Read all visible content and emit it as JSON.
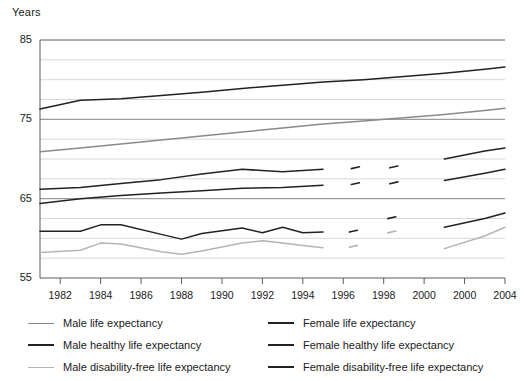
{
  "chart_data": {
    "type": "line",
    "title": "",
    "subtitle": "",
    "ylabel": "Years",
    "xlabel": "",
    "ylim": [
      55,
      85
    ],
    "yticks": [
      55,
      65,
      75,
      85
    ],
    "ytick_labels": [
      "55",
      "65",
      "75",
      "85"
    ],
    "grid": "horizontal-minor-every-2.5-years",
    "gridlines": [
      57.5,
      60,
      62.5,
      65,
      67.5,
      70,
      72.5,
      75,
      77.5,
      80,
      82.5
    ],
    "xlim": [
      1981,
      2004
    ],
    "xticks": [
      1982,
      1984,
      1986,
      1988,
      1990,
      1992,
      1994,
      1996,
      1998,
      2000,
      2002,
      2004
    ],
    "xtick_labels": [
      "1982",
      "1984",
      "1986",
      "1988",
      "1990",
      "1992",
      "1994",
      "1996",
      "1998",
      "2000",
      "2000",
      "2004"
    ],
    "legend_position": "bottom",
    "colors": {
      "male_life": "#8a8a8a",
      "male_healthy": "#222222",
      "male_disability_free": "#b4b4b4",
      "female_life": "#222222",
      "female_healthy": "#222222",
      "female_disability_free": "#222222"
    },
    "series": [
      {
        "name": "Female life expectancy",
        "key": "female_life",
        "color": "#222222",
        "width": 1.5,
        "x": [
          1981,
          1983,
          1985,
          1987,
          1989,
          1991,
          1993,
          1995,
          1997,
          1999,
          2001,
          2003,
          2004
        ],
        "values": [
          76.3,
          77.4,
          77.6,
          78.0,
          78.4,
          78.9,
          79.3,
          79.7,
          80.0,
          80.4,
          80.8,
          81.3,
          81.6
        ]
      },
      {
        "name": "Male life expectancy",
        "key": "male_life",
        "color": "#8a8a8a",
        "width": 1.5,
        "x": [
          1981,
          1983,
          1985,
          1987,
          1989,
          1991,
          1993,
          1995,
          1997,
          1999,
          2001,
          2003,
          2004
        ],
        "values": [
          70.9,
          71.4,
          71.9,
          72.4,
          72.9,
          73.4,
          73.9,
          74.4,
          74.8,
          75.2,
          75.6,
          76.1,
          76.4
        ]
      },
      {
        "name": "Female healthy life expectancy",
        "key": "female_healthy",
        "color": "#222222",
        "width": 1.5,
        "x": [
          1981,
          1983,
          1985,
          1987,
          1989,
          1991,
          1993,
          1995
        ],
        "values": [
          66.2,
          66.4,
          66.9,
          67.4,
          68.1,
          68.7,
          68.4,
          68.7
        ],
        "x2": [
          2001,
          2003,
          2004
        ],
        "values2": [
          70.0,
          71.0,
          71.4
        ],
        "gap": [
          1995,
          2001
        ]
      },
      {
        "name": "Male healthy life expectancy",
        "key": "male_healthy",
        "color": "#222222",
        "width": 1.5,
        "x": [
          1981,
          1983,
          1985,
          1987,
          1989,
          1991,
          1993,
          1995
        ],
        "values": [
          64.4,
          65.0,
          65.4,
          65.7,
          66.0,
          66.3,
          66.4,
          66.7
        ],
        "x2": [
          2001,
          2003,
          2004
        ],
        "values2": [
          67.3,
          68.2,
          68.7
        ],
        "gap": [
          1995,
          2001
        ]
      },
      {
        "name": "Female disability-free life expectancy",
        "key": "female_disability_free",
        "color": "#222222",
        "width": 1.5,
        "x": [
          1981,
          1983,
          1984,
          1985,
          1987,
          1988,
          1989,
          1991,
          1992,
          1993,
          1994,
          1995
        ],
        "values": [
          60.9,
          60.9,
          61.7,
          61.7,
          60.5,
          59.9,
          60.6,
          61.3,
          60.7,
          61.4,
          60.7,
          60.8
        ],
        "x2": [
          2001,
          2003,
          2004
        ],
        "values2": [
          61.4,
          62.5,
          63.2
        ],
        "gap": [
          1995,
          2001
        ]
      },
      {
        "name": "Male disability-free life expectancy",
        "key": "male_disability_free",
        "color": "#b4b4b4",
        "width": 1.5,
        "x": [
          1981,
          1983,
          1984,
          1985,
          1987,
          1988,
          1989,
          1991,
          1992,
          1993,
          1994,
          1995
        ],
        "values": [
          58.2,
          58.5,
          59.4,
          59.3,
          58.3,
          58.0,
          58.4,
          59.4,
          59.7,
          59.4,
          59.1,
          58.8
        ],
        "x2": [
          2001,
          2003,
          2004
        ],
        "values2": [
          58.7,
          60.3,
          61.4
        ],
        "gap": [
          1995,
          2001
        ]
      }
    ],
    "gap_fragments": [
      {
        "key": "female_healthy",
        "x": 1996.6,
        "y": 68.9,
        "color": "#222222"
      },
      {
        "key": "female_healthy",
        "x": 1998.5,
        "y": 69.0,
        "color": "#222222"
      },
      {
        "key": "male_healthy",
        "x": 1996.6,
        "y": 66.9,
        "color": "#222222"
      },
      {
        "key": "male_healthy",
        "x": 1998.5,
        "y": 67.0,
        "color": "#222222"
      },
      {
        "key": "female_disability_free",
        "x": 1998.4,
        "y": 62.6,
        "color": "#222222"
      },
      {
        "key": "female_disability_free",
        "x": 1996.5,
        "y": 60.9,
        "color": "#222222"
      },
      {
        "key": "male_disability_free",
        "x": 1998.4,
        "y": 60.8,
        "color": "#b4b4b4"
      },
      {
        "key": "male_disability_free",
        "x": 1996.5,
        "y": 59.0,
        "color": "#b4b4b4"
      }
    ]
  },
  "legend": {
    "left": [
      {
        "label": "Male life expectancy",
        "color": "#8a8a8a",
        "width": 1.5
      },
      {
        "label": "Male healthy life expectancy",
        "color": "#222222",
        "width": 2.0
      },
      {
        "label": "Male disability-free life expectancy",
        "color": "#b4b4b4",
        "width": 1.5
      }
    ],
    "right": [
      {
        "label": "Female life expectancy",
        "color": "#222222",
        "width": 2.0
      },
      {
        "label": "Female healthy life expectancy",
        "color": "#222222",
        "width": 2.0
      },
      {
        "label": "Female disability-free life expectancy",
        "color": "#222222",
        "width": 2.0
      }
    ]
  }
}
